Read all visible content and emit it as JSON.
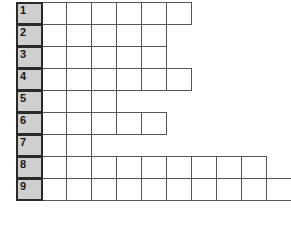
{
  "puzzle": {
    "type": "crossword-grid",
    "title": "",
    "cell_width_px": 26,
    "cell_height_px": 23,
    "colors": {
      "background": "#ffffff",
      "cell_fill": "#ffffff",
      "cell_border": "#565656",
      "number_cell_fill": "#cfcfcf",
      "number_cell_border": "#2a2a2a",
      "number_text": "#1a1a1a"
    },
    "rows": [
      {
        "number": "1",
        "cells": 6
      },
      {
        "number": "2",
        "cells": 5
      },
      {
        "number": "3",
        "cells": 5
      },
      {
        "number": "4",
        "cells": 6
      },
      {
        "number": "5",
        "cells": 3
      },
      {
        "number": "6",
        "cells": 5
      },
      {
        "number": "7",
        "cells": 2
      },
      {
        "number": "8",
        "cells": 9
      },
      {
        "number": "9",
        "cells": 10
      }
    ]
  }
}
